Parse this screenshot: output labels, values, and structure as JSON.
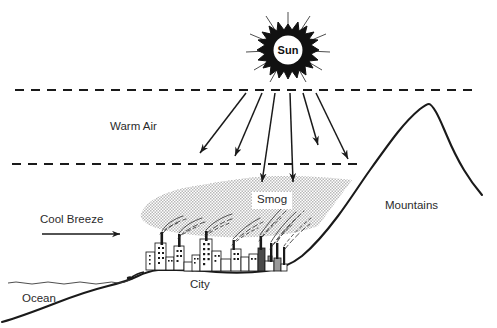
{
  "diagram": {
    "background_color": "#ffffff",
    "ink_color": "#1a1a1a",
    "smog_color": "#c9c9c9",
    "labels": {
      "sun": "Sun",
      "warm_air": "Warm Air",
      "smog": "Smog",
      "mountains": "Mountains",
      "cool_breeze": "Cool Breeze",
      "city": "City",
      "ocean": "Ocean"
    },
    "elements": {
      "sun": {
        "name": "sun",
        "center_x": 288,
        "center_y": 50,
        "burst_radius": 24,
        "disc_radius": 15,
        "ray_count": 20,
        "style": "black spiked starburst with white center disc"
      },
      "inversion_layer": {
        "top_dashed_line_y": 90,
        "bottom_dashed_line_y": 164,
        "top_line_x_start": 15,
        "top_line_x_end": 478,
        "bottom_line_x_start": 12,
        "bottom_line_x_end": 360,
        "dash_pattern": "9 7"
      },
      "sun_rays": [
        {
          "x1": 246,
          "y1": 93,
          "x2": 200,
          "y2": 153
        },
        {
          "x1": 262,
          "y1": 93,
          "x2": 235,
          "y2": 156
        },
        {
          "x1": 275,
          "y1": 93,
          "x2": 262,
          "y2": 182
        },
        {
          "x1": 290,
          "y1": 93,
          "x2": 293,
          "y2": 182
        },
        {
          "x1": 303,
          "y1": 93,
          "x2": 318,
          "y2": 145
        },
        {
          "x1": 316,
          "y1": 93,
          "x2": 348,
          "y2": 159
        }
      ],
      "cool_breeze_arrow": {
        "x1": 42,
        "y1": 234,
        "x2": 120,
        "y2": 234
      },
      "ocean_surface_y": 283,
      "mountain_peak": {
        "x": 428,
        "y": 105
      },
      "city_span": {
        "x_start": 145,
        "y_baseline": 270,
        "x_end": 285
      },
      "smog_cloud": {
        "x_start": 140,
        "x_end": 357,
        "y_top": 176,
        "y_bottom": 238
      }
    }
  }
}
